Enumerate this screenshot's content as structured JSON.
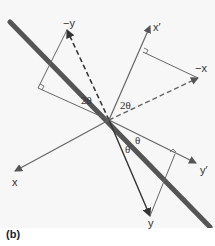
{
  "figure": {
    "caption": "(b)",
    "labels": {
      "neg_y": "−y",
      "y": "y",
      "x_prime": "x′",
      "neg_x": "−x",
      "x": "x",
      "y_prime": "y′",
      "two_theta_left": "2θ",
      "two_theta_right": "2θ",
      "theta_upper": "θ",
      "theta_lower": "θ"
    },
    "colors": {
      "mirror_line": "#555555",
      "axis": "#666666",
      "vector": "#333333",
      "background": "#f7f7f7"
    }
  }
}
